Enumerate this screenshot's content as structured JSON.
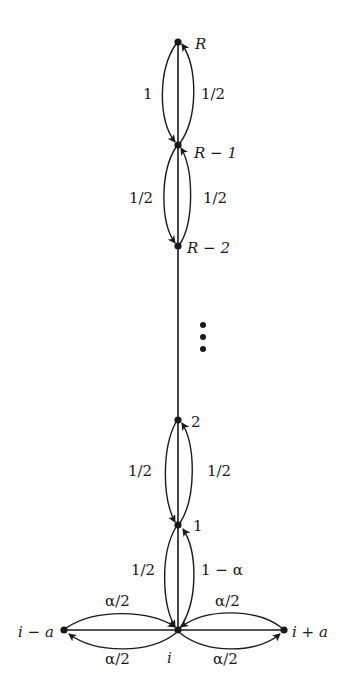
{
  "diagram": {
    "type": "markov-chain-state-diagram",
    "nodes": [
      {
        "id": "R",
        "label": "R"
      },
      {
        "id": "R-1",
        "label": "R − 1"
      },
      {
        "id": "R-2",
        "label": "R − 2"
      },
      {
        "id": "2",
        "label": "2"
      },
      {
        "id": "1",
        "label": "1"
      },
      {
        "id": "i",
        "label": "i"
      },
      {
        "id": "i-a",
        "label": "i − a"
      },
      {
        "id": "i+a",
        "label": "i + a"
      }
    ],
    "ellipsis": "⋮",
    "edges": [
      {
        "from": "R",
        "to": "R-1",
        "label": "1"
      },
      {
        "from": "R-1",
        "to": "R",
        "label": "1/2"
      },
      {
        "from": "R-1",
        "to": "R-2",
        "label": "1/2"
      },
      {
        "from": "R-2",
        "to": "R-1",
        "label": "1/2"
      },
      {
        "from": "2",
        "to": "1",
        "label": "1/2"
      },
      {
        "from": "1",
        "to": "2",
        "label": "1/2"
      },
      {
        "from": "1",
        "to": "i",
        "label": "1/2"
      },
      {
        "from": "i",
        "to": "1",
        "label": "1 − α"
      },
      {
        "from": "i-a",
        "to": "i",
        "label": "α/2"
      },
      {
        "from": "i",
        "to": "i-a",
        "label": "α/2"
      },
      {
        "from": "i+a",
        "to": "i",
        "label": "α/2"
      },
      {
        "from": "i",
        "to": "i+a",
        "label": "α/2"
      }
    ]
  },
  "labels": {
    "R": "R",
    "Rm1": "R − 1",
    "Rm2": "R − 2",
    "two": "2",
    "one": "1",
    "i": "i",
    "im_a": "i − a",
    "ip_a": "i + a",
    "e_R_Rm1_left": "1",
    "e_R_Rm1_right": "1/2",
    "e_Rm1_Rm2_left": "1/2",
    "e_Rm1_Rm2_right": "1/2",
    "e_2_1_left": "1/2",
    "e_2_1_right": "1/2",
    "e_1_i_left": "1/2",
    "e_1_i_right": "1 − α",
    "e_left_top": "α/2",
    "e_left_bottom": "α/2",
    "e_right_top": "α/2",
    "e_right_bottom": "α/2"
  }
}
